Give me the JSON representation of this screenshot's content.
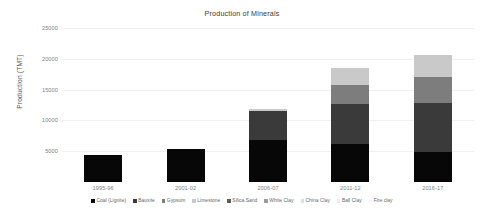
{
  "chart_data": {
    "type": "bar",
    "stacked": true,
    "title": "Production of Minerals",
    "xlabel": "",
    "ylabel": "Production (TMT)",
    "ylim": [
      0,
      25000
    ],
    "yticks": [
      5000,
      10000,
      15000,
      20000,
      25000
    ],
    "ytick_labels": [
      "5000",
      "10000",
      "15000",
      "20000",
      "25000"
    ],
    "grid": true,
    "legend_position": "bottom",
    "categories": [
      "1995-96",
      "2001-02",
      "2006-07",
      "2011-12",
      "2016-17"
    ],
    "series": [
      {
        "name": "Coal (Lignite)",
        "color": "#070707",
        "values": [
          4450,
          5300,
          6900,
          6150,
          4900
        ]
      },
      {
        "name": "Bauxite",
        "color": "#3a3a3a",
        "values": [
          0,
          0,
          4550,
          6500,
          8000
        ]
      },
      {
        "name": "Gypsum",
        "color": "#7d7d7d",
        "values": [
          0,
          0,
          150,
          3050,
          4100
        ]
      },
      {
        "name": "Limestone",
        "color": "#c9c9c9",
        "values": [
          0,
          0,
          200,
          2750,
          3600
        ]
      },
      {
        "name": "Silica Sand",
        "color": "#5c5c5c",
        "values": [
          0,
          0,
          0,
          0,
          0
        ]
      },
      {
        "name": "White Clay",
        "color": "#9a9a9a",
        "values": [
          0,
          0,
          0,
          0,
          0
        ]
      },
      {
        "name": "China Clay",
        "color": "#dedede",
        "values": [
          0,
          0,
          0,
          0,
          0
        ]
      },
      {
        "name": "Ball Clay",
        "color": "#eeeeee",
        "values": [
          0,
          0,
          0,
          0,
          0
        ]
      },
      {
        "name": "Fire clay",
        "color": "#f7f7f7",
        "values": [
          0,
          0,
          0,
          0,
          0
        ]
      }
    ],
    "totals": [
      4450,
      5300,
      11800,
      18450,
      20600
    ]
  },
  "legend": {
    "items": [
      {
        "label": "Coal (Lignite)",
        "color": "#070707"
      },
      {
        "label": "Bauxite",
        "color": "#3a3a3a"
      },
      {
        "label": "Gypsum",
        "color": "#7d7d7d"
      },
      {
        "label": "Limestone",
        "color": "#c9c9c9"
      },
      {
        "label": "Silica Sand",
        "color": "#5c5c5c"
      },
      {
        "label": "White Clay",
        "color": "#9a9a9a"
      },
      {
        "label": "China Clay",
        "color": "#dedede"
      },
      {
        "label": "Ball Clay",
        "color": "#eeeeee"
      },
      {
        "label": "Fire clay",
        "color": "#f7f7f7"
      }
    ]
  },
  "colors": {
    "background": "#ffffff",
    "grid": "#f0f0f0",
    "tick_text": "#808080",
    "title_text": "#3b3b3b",
    "axis_title_text": "#555555"
  }
}
